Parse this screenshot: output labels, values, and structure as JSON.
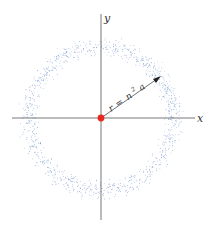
{
  "diagram": {
    "axes": {
      "x_label": "x",
      "y_label": "y"
    },
    "radius_label": {
      "lhs": "r",
      "eq": "=",
      "n": "n",
      "exp": "2",
      "a": "a"
    },
    "colors": {
      "axis": "#555555",
      "dots": "#5a7fc0",
      "nucleus": "#e8281e",
      "arrow": "#333333"
    },
    "geometry": {
      "cx": 101,
      "cy": 118,
      "ring_radius": 72,
      "ring_width": 16,
      "dot_count": 1100
    }
  }
}
